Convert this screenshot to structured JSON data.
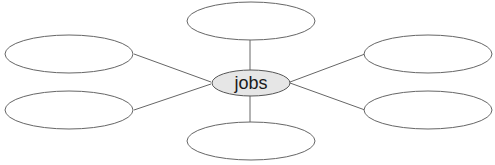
{
  "diagram": {
    "type": "spider-map",
    "center": {
      "label": "jobs",
      "fill": "#e6e6e6"
    },
    "branches": [
      {
        "position": "top",
        "label": ""
      },
      {
        "position": "upper-left",
        "label": ""
      },
      {
        "position": "lower-left",
        "label": ""
      },
      {
        "position": "upper-right",
        "label": ""
      },
      {
        "position": "lower-right",
        "label": ""
      },
      {
        "position": "bottom",
        "label": ""
      }
    ],
    "stroke_color": "#666666"
  }
}
